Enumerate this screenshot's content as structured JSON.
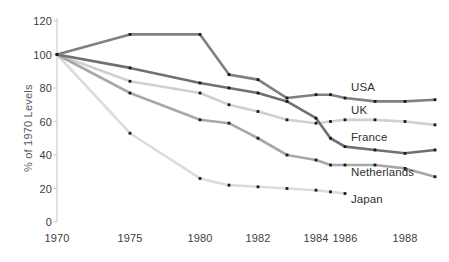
{
  "chart_data": {
    "type": "line",
    "title": "",
    "subtitle": "",
    "xlabel": "",
    "ylabel": "% of 1970 Levels",
    "xlim": [
      1970,
      1989
    ],
    "ylim": [
      0,
      120
    ],
    "yticks": [
      0,
      20,
      40,
      60,
      80,
      100,
      120
    ],
    "xticks": [
      1970,
      1975,
      1980,
      1982,
      1984,
      1986,
      1988
    ],
    "xtick_labels": [
      "1970",
      "1975",
      "1980",
      "1982",
      "1984",
      "1986",
      "1988"
    ],
    "ytick_labels": [
      "0",
      "20",
      "40",
      "60",
      "80",
      "100",
      "120"
    ],
    "grid": false,
    "legend_position": "inline-right",
    "axis_note": "x-axis spacing is non-uniform: 5-year gaps 1970-1980, then 2-year gaps",
    "markers": "small black squares at data points",
    "series": [
      {
        "name": "USA",
        "color": "#808080",
        "label_x": 1986.2,
        "label_y": 80,
        "x": [
          1970,
          1975,
          1980,
          1981,
          1982,
          1983,
          1984,
          1985,
          1986,
          1987,
          1988,
          1989
        ],
        "values": [
          100,
          112,
          112,
          88,
          85,
          74,
          76,
          76,
          74,
          72,
          72,
          73
        ]
      },
      {
        "name": "UK",
        "color": "#d0d0d0",
        "label_x": 1986.2,
        "label_y": 66,
        "x": [
          1970,
          1975,
          1980,
          1981,
          1982,
          1983,
          1984,
          1985,
          1986,
          1987,
          1988,
          1989
        ],
        "values": [
          100,
          84,
          77,
          70,
          66,
          61,
          59,
          60,
          61,
          61,
          60,
          58
        ]
      },
      {
        "name": "France",
        "color": "#707070",
        "label_x": 1986.2,
        "label_y": 50,
        "x": [
          1970,
          1975,
          1980,
          1981,
          1982,
          1983,
          1984,
          1985,
          1986,
          1987,
          1988,
          1989
        ],
        "values": [
          100,
          92,
          83,
          80,
          77,
          72,
          62,
          50,
          45,
          43,
          41,
          43
        ]
      },
      {
        "name": "Netherlands",
        "color": "#a8a8a8",
        "label_x": 1986.2,
        "label_y": 29,
        "x": [
          1970,
          1975,
          1980,
          1981,
          1982,
          1983,
          1984,
          1985,
          1986,
          1987,
          1988,
          1989
        ],
        "values": [
          100,
          77,
          61,
          59,
          50,
          40,
          37,
          34,
          34,
          34,
          32,
          27
        ]
      },
      {
        "name": "Japan",
        "color": "#dcdcdc",
        "label_x": 1986.2,
        "label_y": 13,
        "x": [
          1970,
          1975,
          1980,
          1981,
          1982,
          1983,
          1984,
          1985,
          1986
        ],
        "values": [
          100,
          53,
          26,
          22,
          21,
          20,
          19,
          18,
          17
        ]
      }
    ]
  },
  "colors": {
    "background": "#ffffff",
    "axis": "#cfcfcf",
    "tick_text": "#404040",
    "ylabel_text": "#5a5a6a",
    "marker": "#1a1a1a"
  }
}
